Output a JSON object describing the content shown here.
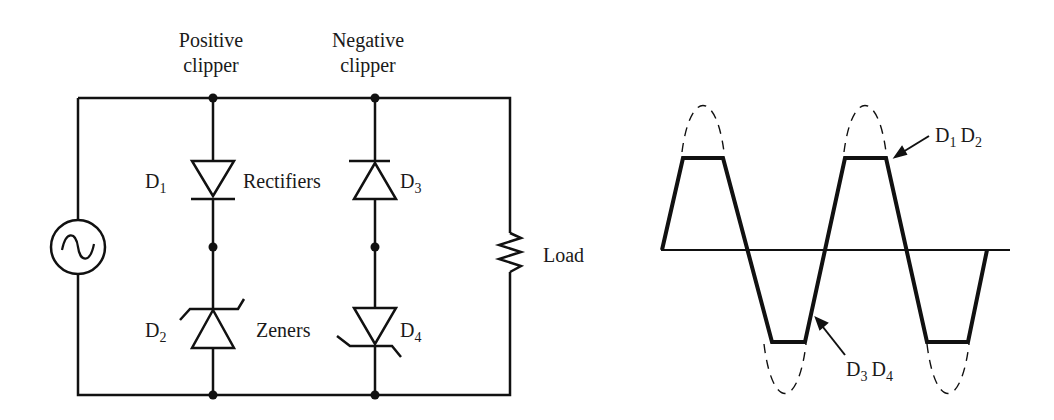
{
  "circuit": {
    "positive_clipper_label": [
      "Positive",
      "clipper"
    ],
    "negative_clipper_label": [
      "Negative",
      "clipper"
    ],
    "rectifiers_label": "Rectifiers",
    "zeners_label": "Zeners",
    "load_label": "Load",
    "diodes": {
      "d1": {
        "letter": "D",
        "sub": "1"
      },
      "d2": {
        "letter": "D",
        "sub": "2"
      },
      "d3": {
        "letter": "D",
        "sub": "3"
      },
      "d4": {
        "letter": "D",
        "sub": "4"
      }
    },
    "source_icon": "ac-source-icon",
    "load_icon": "resistor-icon"
  },
  "waveform": {
    "top_clip_label": {
      "a": "D",
      "a_sub": "1",
      "b": "D",
      "b_sub": "2"
    },
    "bottom_clip_label": {
      "a": "D",
      "a_sub": "3",
      "b": "D",
      "b_sub": "4"
    }
  },
  "colors": {
    "stroke": "#111111",
    "background": "#ffffff"
  }
}
